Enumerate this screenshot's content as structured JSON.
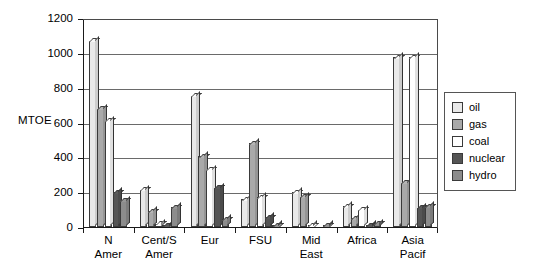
{
  "chart_data": {
    "type": "bar",
    "title": "",
    "subtitle": "",
    "xlabel": "",
    "ylabel": "MTOE",
    "ylim": [
      0,
      1200
    ],
    "ytick_step": 200,
    "yticks": [
      0,
      200,
      400,
      600,
      800,
      1000,
      1200
    ],
    "ytick_labels": [
      "0",
      "200",
      "400",
      "600",
      "800",
      "1000",
      "1200"
    ],
    "grid": true,
    "grid_axis": "y",
    "legend_position": "right",
    "categories": [
      "N Amer",
      "Cent/S Amer",
      "Eur",
      "FSU",
      "Mid East",
      "Africa",
      "Asia Pacif"
    ],
    "category_labels": [
      "N\nAmer",
      "Cent/S\nAmer",
      "Eur",
      "FSU",
      "Mid\nEast",
      "Africa",
      "Asia\nPacif"
    ],
    "series": [
      {
        "name": "oil",
        "color": "#e9e9e9",
        "values": [
          1070,
          215,
          755,
          160,
          200,
          120,
          975
        ]
      },
      {
        "name": "gas",
        "color": "#a9a9a9",
        "values": [
          680,
          90,
          405,
          480,
          175,
          50,
          255
        ]
      },
      {
        "name": "coal",
        "color": "#ffffff",
        "values": [
          610,
          20,
          330,
          170,
          12,
          100,
          975
        ]
      },
      {
        "name": "nuclear",
        "color": "#555555",
        "values": [
          200,
          10,
          225,
          55,
          0,
          10,
          110
        ]
      },
      {
        "name": "hydro",
        "color": "#8c8c8c",
        "values": [
          150,
          115,
          45,
          5,
          12,
          20,
          120
        ]
      }
    ]
  },
  "legend": {
    "items": [
      {
        "label": "oil"
      },
      {
        "label": "gas"
      },
      {
        "label": "coal"
      },
      {
        "label": "nuclear"
      },
      {
        "label": "hydro"
      }
    ]
  }
}
